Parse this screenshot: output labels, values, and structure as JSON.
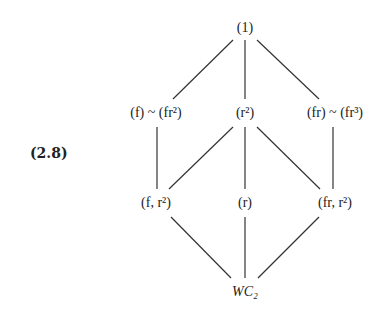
{
  "equation_number": "(2.8)",
  "diagram": {
    "type": "subgroup-lattice",
    "nodes": [
      {
        "id": "top",
        "label": "(1)",
        "x": 245,
        "y": 28
      },
      {
        "id": "f_fr2",
        "label": "(f) ~ (fr²)",
        "x": 156,
        "y": 113
      },
      {
        "id": "r2",
        "label": "(r²)",
        "x": 245,
        "y": 113
      },
      {
        "id": "fr_fr3",
        "label": "(fr) ~ (fr³)",
        "x": 335,
        "y": 113
      },
      {
        "id": "f_r2",
        "label": "(f, r²)",
        "x": 156,
        "y": 203
      },
      {
        "id": "r",
        "label": "(r)",
        "x": 245,
        "y": 203
      },
      {
        "id": "fr_r2",
        "label": "(fr, r²)",
        "x": 335,
        "y": 203
      },
      {
        "id": "bottom",
        "label": "WC₂",
        "x": 245,
        "y": 292
      }
    ],
    "edges": [
      [
        "top",
        "f_fr2"
      ],
      [
        "top",
        "r2"
      ],
      [
        "top",
        "fr_fr3"
      ],
      [
        "f_fr2",
        "f_r2"
      ],
      [
        "r2",
        "f_r2"
      ],
      [
        "r2",
        "r"
      ],
      [
        "r2",
        "fr_r2"
      ],
      [
        "fr_fr3",
        "fr_r2"
      ],
      [
        "f_r2",
        "bottom"
      ],
      [
        "r",
        "bottom"
      ],
      [
        "fr_r2",
        "bottom"
      ]
    ]
  }
}
